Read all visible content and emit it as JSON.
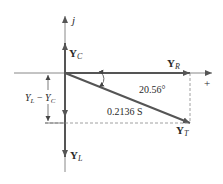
{
  "diagram": {
    "type": "admittance-phasor-diagram",
    "axis": {
      "imaginary_label": "j",
      "real_positive_label": "+"
    },
    "vectors": {
      "capacitive": {
        "label": "Y",
        "subscript": "C"
      },
      "resistive": {
        "label": "Y",
        "subscript": "R"
      },
      "inductive": {
        "label": "Y",
        "subscript": "L"
      },
      "total": {
        "label": "Y",
        "subscript": "T",
        "magnitude": "0.2136 S"
      }
    },
    "angle_label": "20.56°",
    "difference_label": {
      "a": "Y",
      "a_sub": "L",
      "op": " − ",
      "b": "Y",
      "b_sub": "C"
    },
    "colors": {
      "vector": "#555555",
      "axis": "#777777",
      "dashed": "#777777",
      "text": "#2a2a2a"
    }
  }
}
